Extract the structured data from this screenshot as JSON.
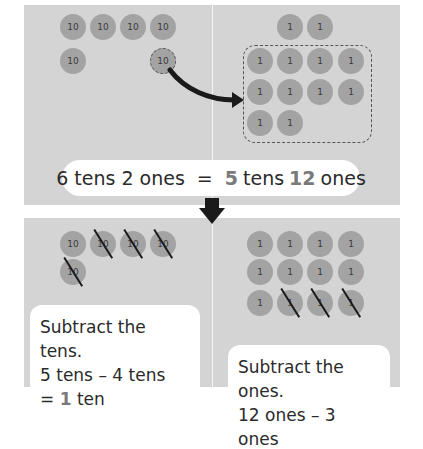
{
  "colors": {
    "panel_bg": "#d4d4d4",
    "counter_fill": "#a3a3a3",
    "counter_text": "#3a3a3a",
    "highlight_number": "#7a7a7a",
    "arrow": "#1a1a1a",
    "text": "#2a2a2a"
  },
  "top": {
    "tens_counters": [
      {
        "label": "10",
        "x": 73,
        "y": 27
      },
      {
        "label": "10",
        "x": 103,
        "y": 27
      },
      {
        "label": "10",
        "x": 133,
        "y": 27
      },
      {
        "label": "10",
        "x": 163,
        "y": 27
      },
      {
        "label": "10",
        "x": 73,
        "y": 61
      }
    ],
    "exchanged_ten": {
      "label": "10",
      "x": 163,
      "y": 61
    },
    "ones_outside": [
      {
        "label": "1",
        "x": 290,
        "y": 27
      },
      {
        "label": "1",
        "x": 320,
        "y": 27
      }
    ],
    "ones_in_group": [
      {
        "label": "1",
        "x": 260,
        "y": 61
      },
      {
        "label": "1",
        "x": 290,
        "y": 61
      },
      {
        "label": "1",
        "x": 320,
        "y": 61
      },
      {
        "label": "1",
        "x": 351,
        "y": 61
      },
      {
        "label": "1",
        "x": 260,
        "y": 92
      },
      {
        "label": "1",
        "x": 290,
        "y": 92
      },
      {
        "label": "1",
        "x": 320,
        "y": 92
      },
      {
        "label": "1",
        "x": 351,
        "y": 92
      },
      {
        "label": "1",
        "x": 260,
        "y": 123
      },
      {
        "label": "1",
        "x": 290,
        "y": 123
      }
    ],
    "equation": {
      "left": "6 tens 2 ones",
      "equals": "=",
      "tens_value": "5",
      "tens_word": "tens",
      "ones_value": "12",
      "ones_word": "ones"
    }
  },
  "bottom": {
    "tens_counters": [
      {
        "label": "10",
        "x": 73,
        "y": 244,
        "crossed": false
      },
      {
        "label": "10",
        "x": 103,
        "y": 244,
        "crossed": true
      },
      {
        "label": "10",
        "x": 133,
        "y": 244,
        "crossed": true
      },
      {
        "label": "10",
        "x": 163,
        "y": 244,
        "crossed": true
      },
      {
        "label": "10",
        "x": 73,
        "y": 272,
        "crossed": true
      }
    ],
    "ones_counters": [
      {
        "label": "1",
        "x": 260,
        "y": 244,
        "crossed": false
      },
      {
        "label": "1",
        "x": 290,
        "y": 244,
        "crossed": false
      },
      {
        "label": "1",
        "x": 320,
        "y": 244,
        "crossed": false
      },
      {
        "label": "1",
        "x": 351,
        "y": 244,
        "crossed": false
      },
      {
        "label": "1",
        "x": 260,
        "y": 272,
        "crossed": false
      },
      {
        "label": "1",
        "x": 290,
        "y": 272,
        "crossed": false
      },
      {
        "label": "1",
        "x": 320,
        "y": 272,
        "crossed": false
      },
      {
        "label": "1",
        "x": 351,
        "y": 272,
        "crossed": false
      },
      {
        "label": "1",
        "x": 260,
        "y": 303,
        "crossed": false
      },
      {
        "label": "1",
        "x": 290,
        "y": 303,
        "crossed": true
      },
      {
        "label": "1",
        "x": 320,
        "y": 303,
        "crossed": true
      },
      {
        "label": "1",
        "x": 351,
        "y": 303,
        "crossed": true
      }
    ],
    "tens_text": {
      "line1": "Subtract the tens.",
      "line2": "5 tens – 4 tens",
      "line3_prefix": "= ",
      "line3_value": "1",
      "line3_suffix": " ten"
    },
    "ones_text": {
      "line1": "Subtract the ones.",
      "line2_partial": "12 ones – 3 ones"
    }
  }
}
